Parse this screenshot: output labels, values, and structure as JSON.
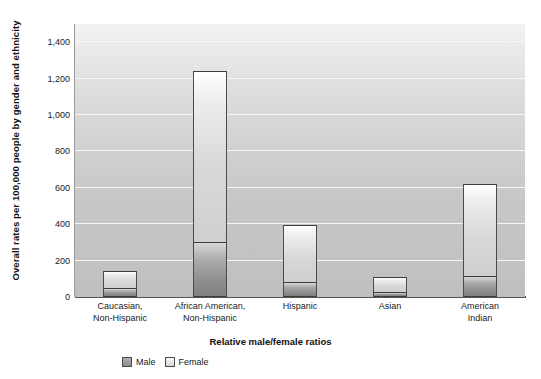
{
  "chart_data": {
    "type": "bar",
    "stacked": true,
    "title": "",
    "xlabel": "Relative male/female ratios",
    "ylabel": "Overall rates per 100,000 people by gender and ethnicity",
    "categories": [
      "Caucasian,\nNon-Hispanic",
      "African American,\nNon-Hispanic",
      "Hispanic",
      "Asian",
      "American\nIndian"
    ],
    "series": [
      {
        "name": "Male",
        "color": "#8e8e8e",
        "values": [
          50,
          300,
          85,
          30,
          115
        ]
      },
      {
        "name": "Female",
        "color": "#dcdcdc",
        "values": [
          95,
          940,
          310,
          80,
          505
        ]
      }
    ],
    "totals": [
      145,
      1240,
      395,
      110,
      620
    ],
    "ylim": [
      0,
      1500
    ],
    "yticks": [
      0,
      200,
      400,
      600,
      800,
      1000,
      1200,
      1400
    ],
    "ytick_labels": [
      "0",
      "200",
      "400",
      "600",
      "800",
      "1,000",
      "1,200",
      "1,400"
    ],
    "grid": true,
    "legend_position": "bottom-left"
  },
  "legend": {
    "items": [
      {
        "label": "Male"
      },
      {
        "label": "Female"
      }
    ]
  }
}
